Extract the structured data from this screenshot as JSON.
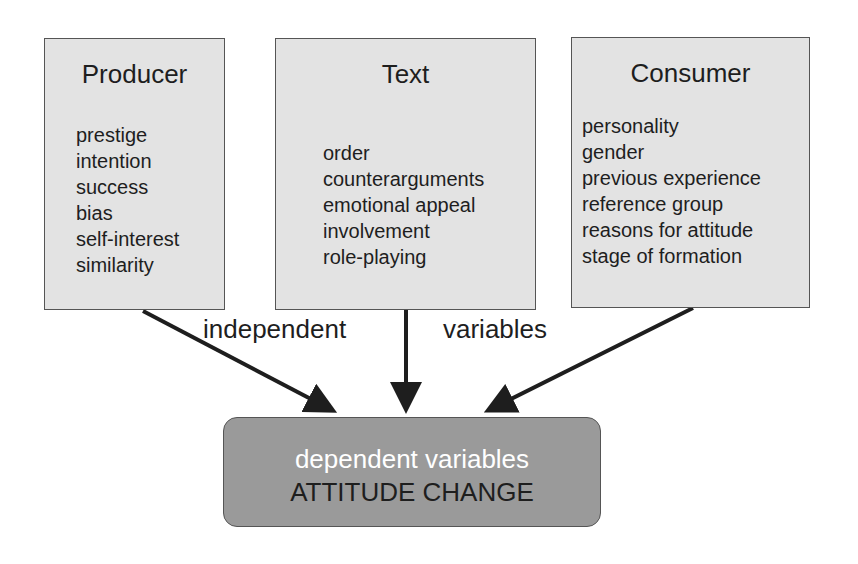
{
  "boxes": [
    {
      "title": "Producer",
      "items": [
        "prestige",
        "intention",
        "success",
        "bias",
        "self-interest",
        "similarity"
      ]
    },
    {
      "title": "Text",
      "items": [
        "order",
        "counterarguments",
        "emotional appeal",
        "involvement",
        "role-playing"
      ]
    },
    {
      "title": "Consumer",
      "items": [
        "personality",
        "gender",
        "previous experience",
        "reference group",
        "reasons for attitude",
        "stage of formation"
      ]
    }
  ],
  "labels": {
    "left": "independent",
    "right": "variables"
  },
  "result": {
    "line1": "dependent variables",
    "line2": "ATTITUDE CHANGE"
  },
  "colors": {
    "box_fill": "#e3e3e3",
    "result_fill": "#9a9a9a",
    "arrow": "#1e1e1e"
  }
}
